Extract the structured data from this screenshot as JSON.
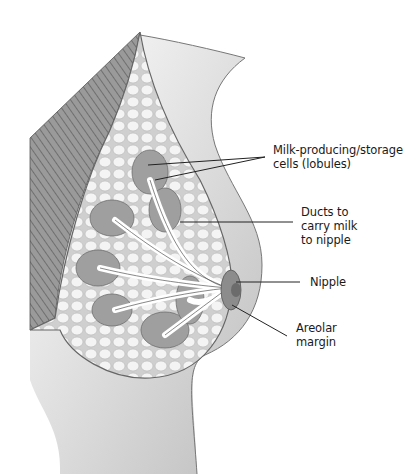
{
  "diagram": {
    "labels": [
      {
        "id": "lobules",
        "lines": [
          "Milk-producing/storage",
          "cells (lobules)"
        ]
      },
      {
        "id": "ducts",
        "lines": [
          "Ducts to",
          "carry milk",
          "to nipple"
        ]
      },
      {
        "id": "nipple",
        "lines": [
          "Nipple"
        ]
      },
      {
        "id": "areolar",
        "lines": [
          "Areolar",
          "margin"
        ]
      }
    ]
  },
  "colors": {
    "background": "#ffffff",
    "skin": "#d9d9d9",
    "skin_shadow": "#a8a8a8",
    "muscle": "#8a8a8a",
    "fat": "#e8e8e8",
    "lobule": "#9a9a9a",
    "duct": "#ffffff",
    "line": "#222222"
  }
}
